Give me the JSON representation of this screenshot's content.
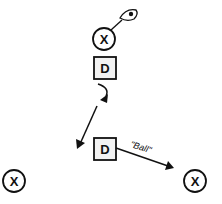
{
  "diagram": {
    "title": "",
    "colors": {
      "stroke": "#111111",
      "background": "#ffffff",
      "box_fill": "#f2f2f2"
    },
    "offense": [
      {
        "id": "x-top",
        "label": "X",
        "cx": 104,
        "cy": 39,
        "r": 11,
        "has_ball": true
      },
      {
        "id": "x-left",
        "label": "X",
        "cx": 14,
        "cy": 181,
        "r": 11,
        "has_ball": false
      },
      {
        "id": "x-right",
        "label": "X",
        "cx": 195,
        "cy": 181,
        "r": 11,
        "has_ball": false
      }
    ],
    "defense": [
      {
        "id": "d-top",
        "label": "D",
        "x": 94,
        "y": 57,
        "w": 22,
        "h": 22
      },
      {
        "id": "d-bottom",
        "label": "D",
        "x": 94,
        "y": 138,
        "w": 22,
        "h": 22
      }
    ],
    "ball_icon": "ball-in-hand-icon",
    "movements": [
      {
        "id": "turn",
        "type": "curved-arrow",
        "description": "defender pivots/turns"
      },
      {
        "id": "drop",
        "type": "arrow",
        "description": "defender drops diagonally down-left"
      },
      {
        "id": "ball-call",
        "type": "arrow",
        "description": "defender slides toward right offensive player",
        "label": "\"Ball\""
      }
    ]
  }
}
